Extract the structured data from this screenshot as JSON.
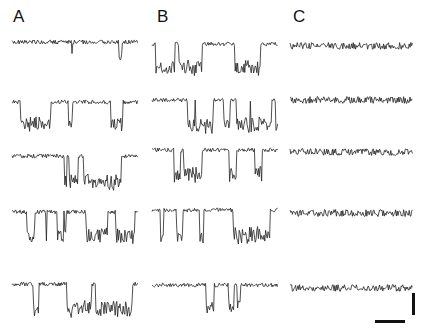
{
  "figure": {
    "panels": [
      {
        "label": "A",
        "x": 13,
        "y": 8
      },
      {
        "label": "B",
        "x": 157,
        "y": 8
      },
      {
        "label": "C",
        "x": 293,
        "y": 8
      }
    ],
    "columns": [
      {
        "panel": "A",
        "x0": 12,
        "x1": 138,
        "baselines": [
          42,
          102,
          156,
          212,
          284
        ],
        "amp": [
          0.15,
          0.55,
          0.85,
          0.7,
          0.8
        ],
        "seed": 11
      },
      {
        "panel": "B",
        "x0": 152,
        "x1": 278,
        "baselines": [
          44,
          100,
          150,
          210,
          285
        ],
        "amp": [
          0.7,
          0.8,
          0.75,
          0.9,
          0.55
        ],
        "seed": 37
      },
      {
        "panel": "C",
        "x0": 290,
        "x1": 413,
        "baselines": [
          46,
          100,
          152,
          213,
          288
        ],
        "amp": [
          0,
          0,
          0,
          0,
          0
        ],
        "seed": 73
      }
    ],
    "trace_color": "#222222",
    "scale_bar": {
      "vertical": {
        "x": 414,
        "y1": 293,
        "y2": 315
      },
      "horizontal": {
        "x1": 375,
        "x2": 405,
        "y": 321
      }
    }
  }
}
